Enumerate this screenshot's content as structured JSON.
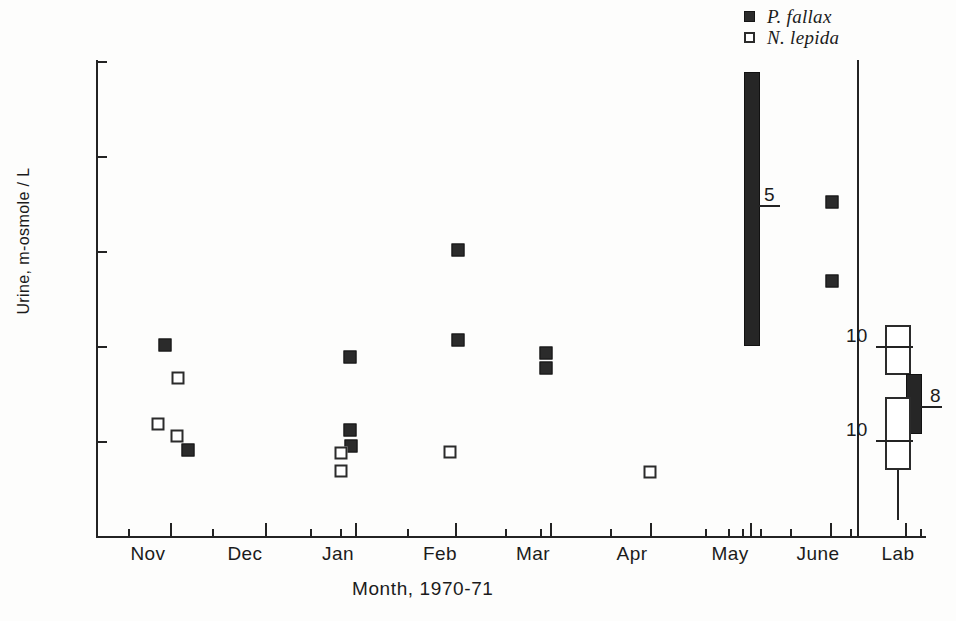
{
  "chart_data": {
    "type": "scatter",
    "title": "",
    "xlabel": "Month, 1970-71",
    "ylabel": "Urine, m-osmole / L",
    "ylim": [
      0,
      5000
    ],
    "yticks": [
      1000,
      2000,
      3000,
      4000,
      5000
    ],
    "ytick_labels": [
      "1000",
      "2000",
      "3000",
      "4000",
      "5000"
    ],
    "xtick_labels": [
      "Nov",
      "Dec",
      "Jan",
      "Feb",
      "Mar",
      "Apr",
      "May",
      "June",
      "Lab"
    ],
    "grid": false,
    "legend_position": "top-right",
    "series": [
      {
        "name": "P. fallax",
        "marker": "filled-square",
        "points": [
          {
            "month": "Nov",
            "value": 2020
          },
          {
            "month": "Nov",
            "value": 920
          },
          {
            "month": "Jan",
            "value": 1890
          },
          {
            "month": "Jan",
            "value": 1130
          },
          {
            "month": "Jan",
            "value": 960
          },
          {
            "month": "Feb",
            "value": 3020
          },
          {
            "month": "Feb",
            "value": 2070
          },
          {
            "month": "Mar",
            "value": 1940
          },
          {
            "month": "Mar",
            "value": 1780
          },
          {
            "month": "June",
            "value": 3530
          },
          {
            "month": "June",
            "value": 2690
          }
        ]
      },
      {
        "name": "N. lepida",
        "marker": "open-square",
        "points": [
          {
            "month": "Nov",
            "value": 1670
          },
          {
            "month": "Nov",
            "value": 1190
          },
          {
            "month": "Nov",
            "value": 1060
          },
          {
            "month": "Jan",
            "value": 880
          },
          {
            "month": "Jan",
            "value": 700
          },
          {
            "month": "Feb",
            "value": 890
          },
          {
            "month": "Apr",
            "value": 680
          }
        ]
      }
    ],
    "range_bars": [
      {
        "name": "May field range - P. fallax",
        "panel": "field",
        "month": "May",
        "fill": "filled",
        "low": 2010,
        "high": 4900,
        "mean": 3500,
        "n": "5"
      },
      {
        "name": "Lab N. lepida upper",
        "panel": "lab",
        "fill": "open",
        "low": 1700,
        "high": 2230,
        "mean": 2010,
        "n": "10"
      },
      {
        "name": "Lab P. fallax",
        "panel": "lab",
        "fill": "filled",
        "low": 1080,
        "high": 1720,
        "mean": 1380,
        "n": "8"
      },
      {
        "name": "Lab N. lepida lower",
        "panel": "lab",
        "fill": "open",
        "low": 700,
        "high": 1470,
        "mean": 1020,
        "n": "10"
      }
    ]
  },
  "legend": {
    "items": [
      {
        "label": "P. fallax",
        "marker": "filled-square"
      },
      {
        "label": "N. lepida",
        "marker": "open-square"
      }
    ]
  },
  "axes": {
    "y_title": "Urine, m-osmole / L",
    "x_title": "Month, 1970-71",
    "y_ticks": [
      {
        "label": "5000",
        "value": 5000
      },
      {
        "label": "4000",
        "value": 4000
      },
      {
        "label": "3000",
        "value": 3000
      },
      {
        "label": "2000",
        "value": 2000
      },
      {
        "label": "1000",
        "value": 1000
      }
    ],
    "x_months": [
      {
        "label": "Nov"
      },
      {
        "label": "Dec"
      },
      {
        "label": "Jan"
      },
      {
        "label": "Feb"
      },
      {
        "label": "Mar"
      },
      {
        "label": "Apr"
      },
      {
        "label": "May"
      },
      {
        "label": "June"
      },
      {
        "label": "Lab"
      }
    ]
  },
  "annotations": {
    "may_n": "5",
    "lab_upper_n": "10",
    "lab_filled_n": "8",
    "lab_lower_n": "10"
  }
}
